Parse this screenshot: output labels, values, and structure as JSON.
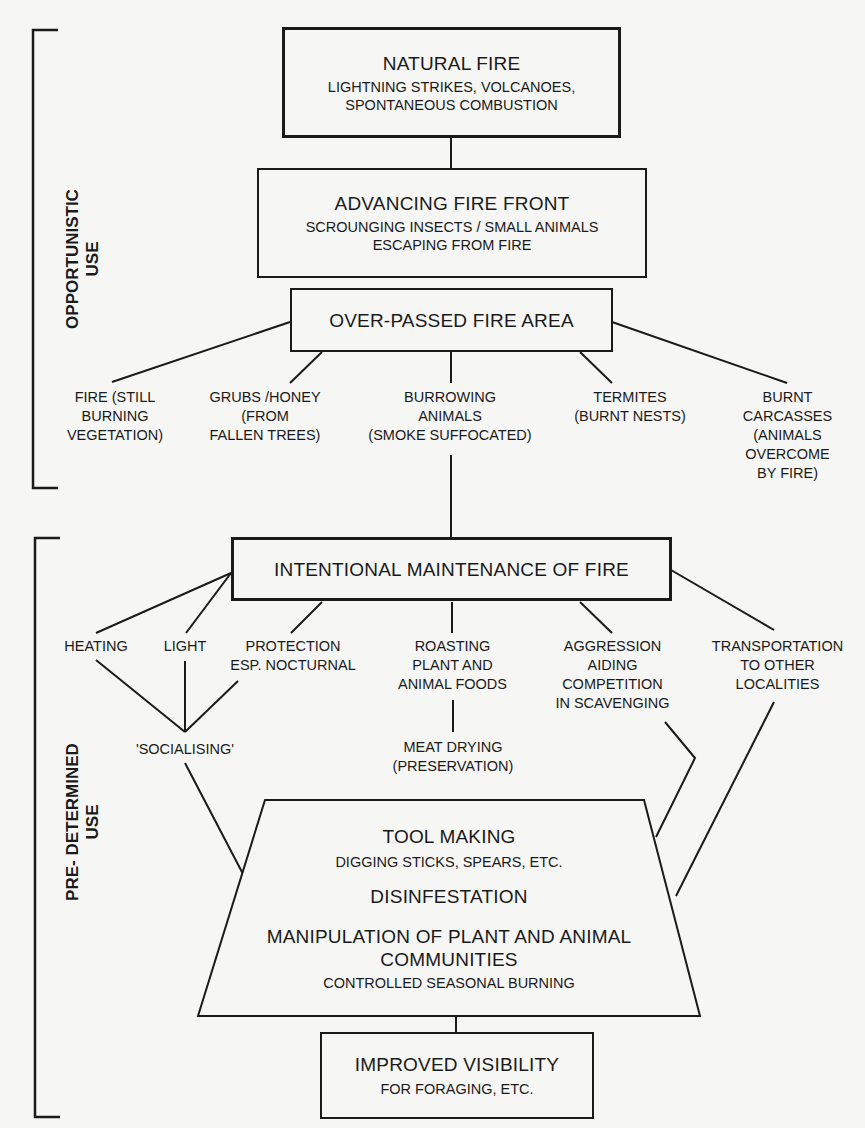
{
  "sections": {
    "opportunistic": "OPPORTUNISTIC\nUSE",
    "predetermined": "PRE- DETERMINED\nUSE"
  },
  "nodes": {
    "natural_fire": {
      "title": "NATURAL FIRE",
      "sub": "LIGHTNING STRIKES, VOLCANOES,",
      "sub2": "SPONTANEOUS COMBUSTION"
    },
    "advancing_front": {
      "title": "ADVANCING FIRE FRONT",
      "sub": "SCROUNGING INSECTS / SMALL ANIMALS",
      "sub2": "ESCAPING FROM FIRE"
    },
    "over_passed": {
      "title": "OVER-PASSED FIRE AREA"
    },
    "intentional": {
      "title": "INTENTIONAL MAINTENANCE OF FIRE"
    },
    "trapezoid": {
      "tool_making": "TOOL MAKING",
      "tool_making_sub": "DIGGING STICKS, SPEARS, ETC.",
      "disinfestation": "DISINFESTATION",
      "manipulation": "MANIPULATION OF PLANT AND ANIMAL",
      "manipulation2": "COMMUNITIES",
      "manipulation_sub": "CONTROLLED SEASONAL BURNING"
    },
    "visibility": {
      "title": "IMPROVED VISIBILITY",
      "sub": "FOR FORAGING, ETC."
    }
  },
  "opportunistic_leaves": [
    "FIRE (STILL\nBURNING\nVEGETATION)",
    "GRUBS /HONEY\n(FROM\nFALLEN TREES)",
    "BURROWING\nANIMALS\n(SMOKE SUFFOCATED)",
    "TERMITES\n(BURNT NESTS)",
    "BURNT\nCARCASSES\n(ANIMALS\nOVERCOME\nBY FIRE)"
  ],
  "predetermined_leaves": {
    "heating": "HEATING",
    "light": "LIGHT",
    "protection": "PROTECTION\nESP. NOCTURNAL",
    "roasting": "ROASTING\nPLANT AND\nANIMAL FOODS",
    "aggression": "AGGRESSION\nAIDING\nCOMPETITION\nIN SCAVENGING",
    "transportation": "TRANSPORTATION\nTO OTHER\nLOCALITIES",
    "socialising": "'SOCIALISING'",
    "meat_drying": "MEAT DRYING\n(PRESERVATION)"
  },
  "colors": {
    "ink": "#1a1a1a",
    "paper": "#f6f6f4"
  }
}
